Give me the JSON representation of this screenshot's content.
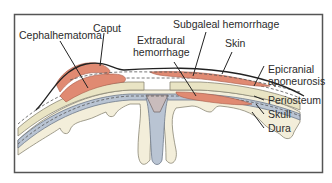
{
  "diagram": {
    "labels": {
      "cephalhematoma": "Cephalhematoma",
      "caput": "Caput",
      "subgaleal": "Subgaleal hemorrhage",
      "extradural_1": "Extradural",
      "extradural_2": "hemorrhage",
      "skin": "Skin",
      "epicranial_1": "Epicranial",
      "epicranial_2": "aponeurosis",
      "periosteum": "Periosteum",
      "skull": "Skull",
      "dura": "Dura"
    },
    "colors": {
      "frame": "#555555",
      "hemorrhage": "#e08a72",
      "skull_bone": "#e9e4c4",
      "brain_fold": "#f3eeda",
      "sinus": "#c9bcbc",
      "dura_blue": "#b9c4d3",
      "line": "#222222"
    }
  }
}
